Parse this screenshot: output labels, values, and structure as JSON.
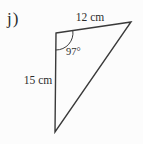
{
  "page": {
    "background": "#fcfcfc"
  },
  "figure": {
    "item_label": "j)",
    "type": "triangle-diagram",
    "line_color": "#3a3a3a",
    "stroke_width": "1.4",
    "triangle": {
      "points": "56,33 131,22 55,132",
      "vertices": {
        "top_left": [
          56,
          33
        ],
        "top_right": [
          131,
          22
        ],
        "bottom": [
          55,
          132
        ]
      }
    },
    "angle": {
      "label": "97°",
      "value_degrees": 97,
      "vertex": "top_left",
      "arc_path": "M 72.8,30.6 A 17,17 0 0 1 55.8,50"
    },
    "sides": {
      "top": {
        "label": "12 cm",
        "value_cm": 12
      },
      "left": {
        "label": "15 cm",
        "value_cm": 15
      }
    }
  }
}
